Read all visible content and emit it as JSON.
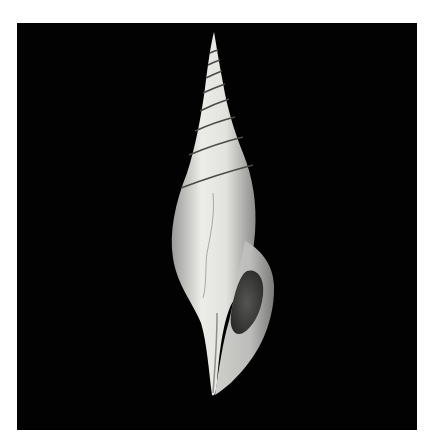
{
  "image": {
    "subject": "spiral gastropod shell on black background",
    "colors": {
      "page_background": "#ffffff",
      "panel_background": "#020202",
      "shell_light": "#e8e8e6",
      "shell_mid": "#bdbdbb",
      "aperture_dark": "#3a3a3a"
    }
  }
}
